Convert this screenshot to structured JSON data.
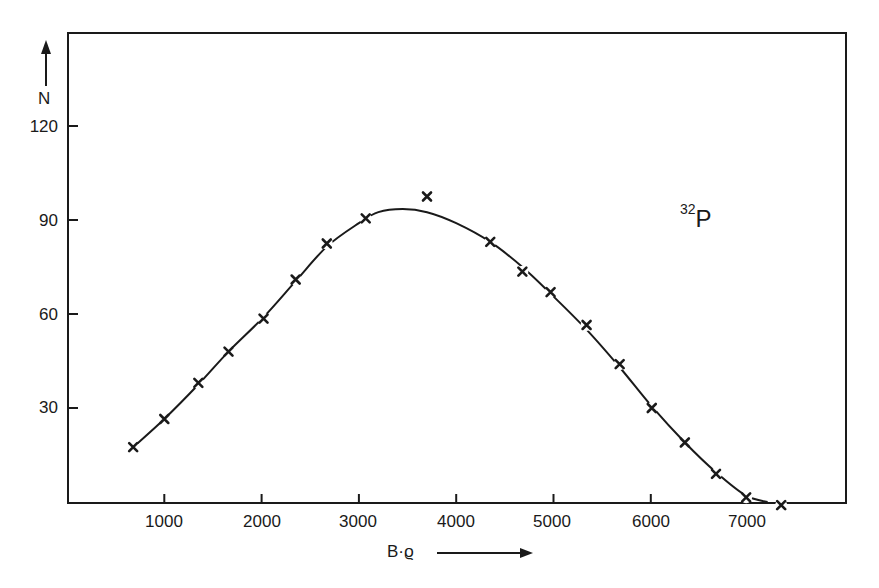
{
  "chart_data": {
    "type": "scatter",
    "title": "",
    "xlabel": "B·ϱ",
    "ylabel": "N",
    "xlim": [
      0,
      8000
    ],
    "ylim": [
      0,
      140
    ],
    "x_ticks": [
      1000,
      2000,
      3000,
      4000,
      5000,
      6000,
      7000
    ],
    "y_ticks": [
      30,
      60,
      90,
      120
    ],
    "grid": false,
    "legend": null,
    "annotations": [
      {
        "text_sup": "32",
        "text": "P",
        "x": 6500,
        "y": 90
      }
    ],
    "series": [
      {
        "name": "measured",
        "marker": "x",
        "points": [
          [
            680,
            17.5
          ],
          [
            1000,
            26.5
          ],
          [
            1350,
            38
          ],
          [
            1660,
            48
          ],
          [
            2020,
            58.5
          ],
          [
            2350,
            71
          ],
          [
            2670,
            82.5
          ],
          [
            3070,
            90.5
          ],
          [
            3700,
            97.5
          ],
          [
            4350,
            83
          ],
          [
            4680,
            73.5
          ],
          [
            4970,
            67
          ],
          [
            5340,
            56.5
          ],
          [
            5680,
            44
          ],
          [
            6010,
            30
          ],
          [
            6350,
            19
          ],
          [
            6670,
            9
          ],
          [
            6980,
            1.5
          ],
          [
            7340,
            -1
          ]
        ]
      },
      {
        "name": "fitted curve",
        "type": "line",
        "points": [
          [
            680,
            17.5
          ],
          [
            1000,
            26.5
          ],
          [
            1350,
            37.5
          ],
          [
            1660,
            48
          ],
          [
            2020,
            59
          ],
          [
            2350,
            70.5
          ],
          [
            2670,
            81.5
          ],
          [
            3000,
            89
          ],
          [
            3200,
            92.5
          ],
          [
            3450,
            93.5
          ],
          [
            3700,
            92.5
          ],
          [
            4000,
            89
          ],
          [
            4350,
            83
          ],
          [
            4680,
            75
          ],
          [
            4970,
            66.5
          ],
          [
            5340,
            55
          ],
          [
            5680,
            43
          ],
          [
            6010,
            30.5
          ],
          [
            6350,
            19
          ],
          [
            6670,
            9.5
          ],
          [
            6980,
            2
          ],
          [
            7200,
            0
          ]
        ]
      }
    ]
  },
  "axes": {
    "y_axis_label": "N",
    "x_axis_label": "B·ϱ",
    "y_tick_labels": [
      "120",
      "90",
      "60",
      "30"
    ],
    "x_tick_labels": [
      "1000",
      "2000",
      "3000",
      "4000",
      "5000",
      "6000",
      "7000"
    ]
  },
  "annotation": {
    "isotope_mass": "32",
    "isotope_symbol": "P"
  }
}
